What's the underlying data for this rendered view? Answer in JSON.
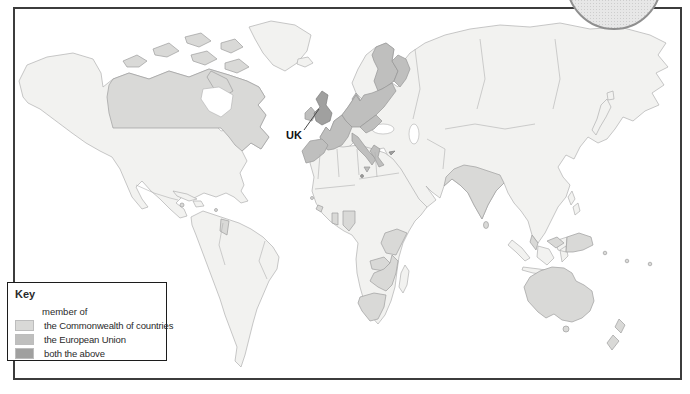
{
  "palette": {
    "non_member": "#f2f2f0",
    "commonwealth": "#d9d9d7",
    "european_union": "#bfbfbe",
    "both": "#a0a09f",
    "outline": "#b0b0b0",
    "frame_border": "#3c3c3c",
    "ocean": "#ffffff",
    "badge_fill": "#e7e7e7",
    "badge_border": "#8f8f8f",
    "leader_line": "#4a4a4a"
  },
  "map": {
    "uk_label": "UK"
  },
  "key": {
    "title": "Key",
    "subtitle": "member of",
    "items": [
      {
        "label": "the Commonwealth of countries",
        "color": "#d9d9d7"
      },
      {
        "label": "the European Union",
        "color": "#bfbfbe"
      },
      {
        "label": "both the above",
        "color": "#a0a09f"
      }
    ]
  },
  "map_data": {
    "type": "choropleth-world-map",
    "annotation": "UK",
    "legend": [
      "the Commonwealth of countries",
      "the European Union",
      "both the above"
    ],
    "regions_shaded": {
      "both_commonwealth_and_eu": [
        "United Kingdom",
        "Malta",
        "Cyprus"
      ],
      "european_union": [
        "Ireland",
        "France",
        "Spain",
        "Portugal",
        "Germany",
        "Denmark",
        "Poland",
        "Baltic states",
        "Central Europe",
        "Italy",
        "Greece",
        "Sweden",
        "Finland"
      ],
      "commonwealth": [
        "Canada",
        "Jamaica",
        "Guyana",
        "Sierra Leone",
        "Ghana",
        "Nigeria",
        "Cameroon",
        "Uganda",
        "Kenya",
        "Tanzania",
        "Zambia",
        "Malawi",
        "Zimbabwe",
        "Botswana",
        "Mozambique",
        "South Africa",
        "India",
        "Bangladesh",
        "Sri Lanka",
        "Malaysia",
        "Papua New Guinea",
        "Australia",
        "New Zealand",
        "Pacific islands"
      ]
    }
  }
}
